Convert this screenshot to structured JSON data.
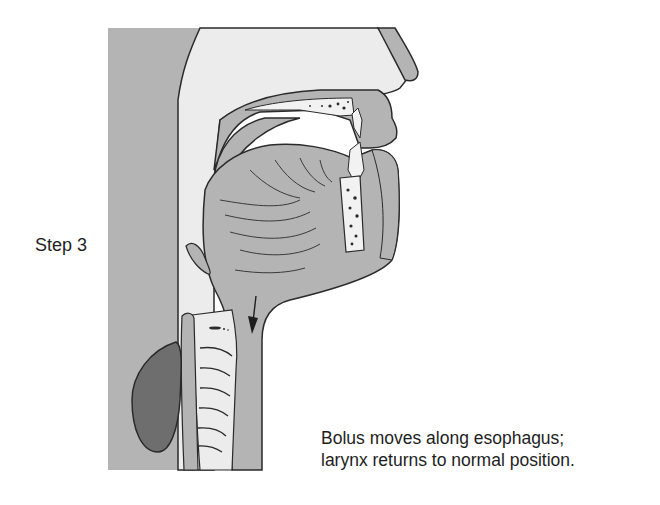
{
  "figure": {
    "step_label": "Step 3",
    "caption_lines": [
      "Bolus moves along esophagus;",
      "larynx returns to normal position."
    ],
    "diagram": {
      "type": "sagittal-section-head-neck",
      "elements": [
        "nasal-cavity",
        "hard-palate",
        "soft-palate",
        "upper-lip",
        "lower-lip",
        "upper-incisor",
        "lower-incisor",
        "mandible",
        "tongue",
        "pharynx",
        "epiglottis",
        "larynx",
        "trachea-rings",
        "esophagus",
        "vertebral-body",
        "bolus-movement-arrow"
      ],
      "arrow_direction": "down"
    },
    "colors": {
      "tissue_gray": "#b4b4b4",
      "cavity_light": "#ececec",
      "bolus_dark": "#6e6e6e",
      "outline": "#2a2a2a",
      "background": "#ffffff"
    }
  }
}
